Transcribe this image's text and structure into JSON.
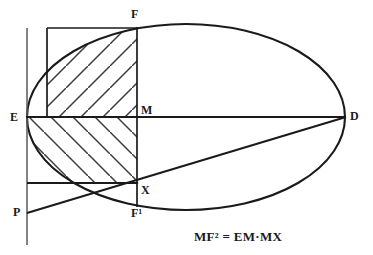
{
  "figure": {
    "kind": "geometry-construction-diagram",
    "width": 373,
    "height": 255,
    "background_color": "#ffffff",
    "ink_color": "#1a1a1a",
    "caption": "MF² = EM·MX",
    "labels": {
      "E": "E",
      "D": "D",
      "F": "F",
      "M": "M",
      "X": "X",
      "F_prime": "F¹",
      "P": "P"
    },
    "points": {
      "E": {
        "x": 27,
        "y": 117
      },
      "D": {
        "x": 345,
        "y": 117
      },
      "F": {
        "x": 137,
        "y": 28
      },
      "M": {
        "x": 137,
        "y": 117
      },
      "X": {
        "x": 137,
        "y": 183
      },
      "F_prime": {
        "x": 137,
        "y": 206
      },
      "P": {
        "x": 27,
        "y": 213
      }
    },
    "ellipse": {
      "center_x": 186,
      "center_y": 117,
      "radius_x": 159,
      "radius_y": 93
    },
    "segments": [
      {
        "name": "major-axis-ED",
        "x1": 27,
        "y1": 117,
        "x2": 345,
        "y2": 117
      },
      {
        "name": "chord-FF-prime",
        "x1": 137,
        "y1": 28,
        "x2": 137,
        "y2": 206
      },
      {
        "name": "secant-P-X-D",
        "x1": 27,
        "y1": 213,
        "x2": 345,
        "y2": 117
      },
      {
        "name": "vertical-left-axis",
        "x1": 27,
        "y1": 28,
        "x2": 27,
        "y2": 245
      },
      {
        "name": "rect-top-edge",
        "x1": 47,
        "y1": 28,
        "x2": 137,
        "y2": 28
      },
      {
        "name": "rect-left-edge",
        "x1": 47,
        "y1": 28,
        "x2": 47,
        "y2": 117
      },
      {
        "name": "chord-X-horizontal",
        "x1": 27,
        "y1": 183,
        "x2": 137,
        "y2": 183
      }
    ],
    "hatched_regions": [
      {
        "name": "upper-square-EMF",
        "x": 47,
        "y": 28,
        "width": 90,
        "height": 89,
        "direction": "up-right"
      },
      {
        "name": "lower-rect-EMX",
        "x": 27,
        "y": 117,
        "width": 110,
        "height": 66,
        "direction": "down-right"
      }
    ]
  }
}
